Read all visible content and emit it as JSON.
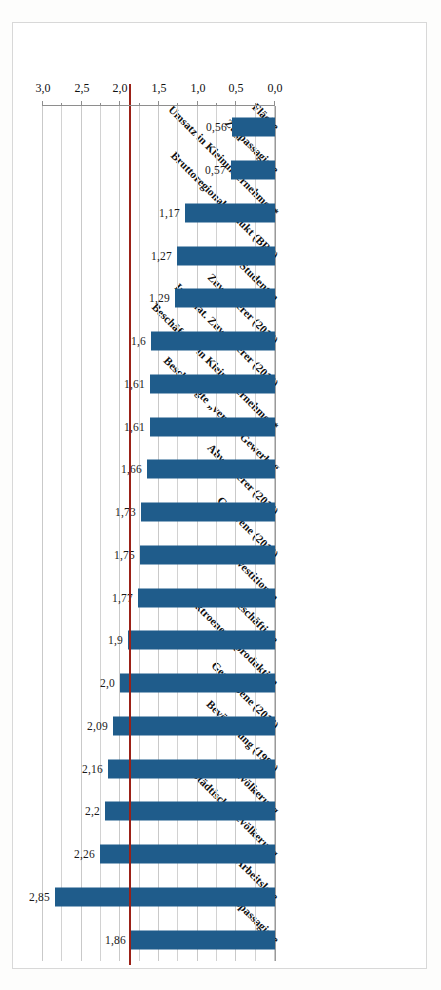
{
  "chart_data": {
    "type": "bar",
    "orientation": "horizontal",
    "title": "",
    "xlabel": "",
    "ylabel": "",
    "xlim": [
      0.0,
      3.0
    ],
    "xticks": [
      "0,0",
      "0,5",
      "1,0",
      "1,5",
      "2,0",
      "2,5",
      "3,0"
    ],
    "xtick_values": [
      0.0,
      0.5,
      1.0,
      1.5,
      2.0,
      2.5,
      3.0
    ],
    "grid": true,
    "legend": "none",
    "bar_color": "#1f5c8b",
    "reference_line": {
      "value": 1.86,
      "color": "#9b2117",
      "label": "1,86"
    },
    "decimal_separator": ",",
    "categories": [
      "Buspassagiere",
      "Arbeitslose",
      "Städtische Bevölkerung",
      "Bevölkerung",
      "Bevölkerung (1989)",
      "Gestorbene (2015)",
      "Elektroenergieproduktion",
      "Beschäftigte",
      "Investitionen",
      "Geborene (2015)",
      "Abwanderer (2015)",
      "Beschäftigte „verarb. Gewerbe“",
      "Beschäftigte in Kleinunternehmen*",
      "Internat. Zuwanderer (2015)",
      "Zuwanderer (2015)",
      "Studenten",
      "Bruttoregionalprodukt (BRP)",
      "Umsatz in Kleinunternehmen*",
      "Zugpassagiere",
      "Fläche"
    ],
    "values": [
      1.86,
      2.85,
      2.26,
      2.2,
      2.16,
      2.09,
      2.0,
      1.9,
      1.77,
      1.75,
      1.73,
      1.66,
      1.61,
      1.61,
      1.6,
      1.29,
      1.27,
      1.17,
      0.57,
      0.56
    ],
    "value_labels": [
      "1,86",
      "2,85",
      "2,26",
      "2,2",
      "2,16",
      "2,09",
      "2,0",
      "1,9",
      "1,77",
      "1,75",
      "1,73",
      "1,66",
      "1,61",
      "1,61",
      "1,6",
      "1,29",
      "1,27",
      "1,17",
      "0,57",
      "0,56"
    ]
  }
}
